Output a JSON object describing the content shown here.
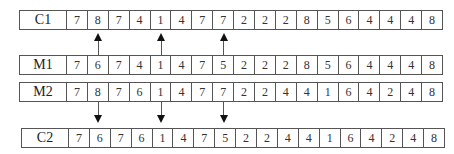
{
  "rows": [
    {
      "label": "C1",
      "values": [
        "7",
        "8",
        "7",
        "4",
        "1",
        "4",
        "7",
        "7",
        "2",
        "2",
        "2",
        "8",
        "5",
        "6",
        "4",
        "4",
        "4",
        "8"
      ]
    },
    {
      "label": "M1",
      "values": [
        "7",
        "6",
        "7",
        "4",
        "1",
        "4",
        "7",
        "5",
        "2",
        "2",
        "2",
        "8",
        "5",
        "6",
        "4",
        "4",
        "4",
        "8"
      ]
    },
    {
      "label": "M2",
      "values": [
        "7",
        "8",
        "7",
        "6",
        "1",
        "4",
        "7",
        "7",
        "2",
        "2",
        "4",
        "4",
        "1",
        "6",
        "4",
        "2",
        "4",
        "8"
      ]
    },
    {
      "label": "C2",
      "values": [
        "7",
        "6",
        "7",
        "6",
        "1",
        "4",
        "7",
        "5",
        "2",
        "2",
        "4",
        "4",
        "1",
        "6",
        "4",
        "2",
        "4",
        "8"
      ]
    }
  ],
  "arrows": {
    "up_from_M1_to_C1_positions": [
      2,
      5,
      8
    ],
    "down_from_M2_to_C2_positions": [
      2,
      5,
      8
    ]
  }
}
